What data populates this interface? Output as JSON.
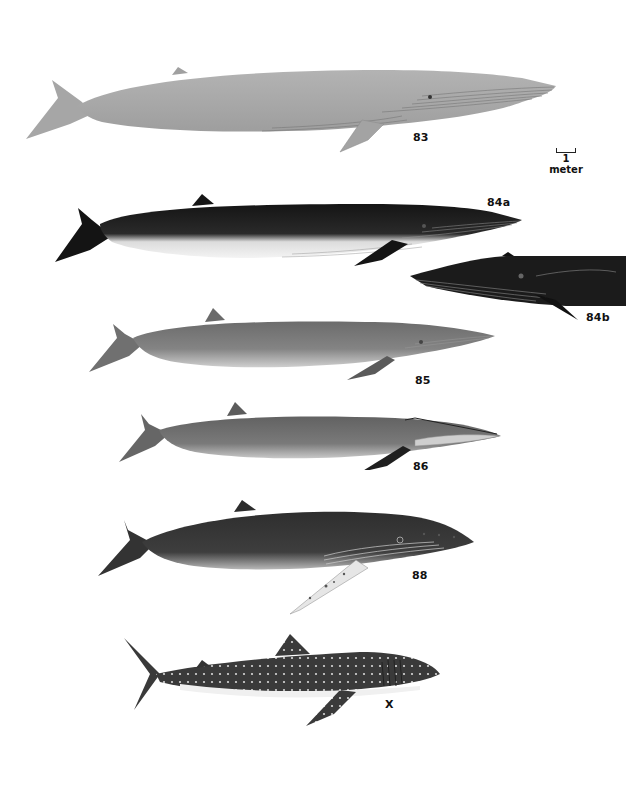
{
  "plate": {
    "background": "#ffffff",
    "scale_bar": {
      "value": "1",
      "unit": "meter"
    },
    "figures": [
      {
        "id": "83",
        "label": "83",
        "description": "Blue whale, pale gray, long slender body with throat grooves",
        "color": "#a9a9a9"
      },
      {
        "id": "84a",
        "label": "84a",
        "description": "Fin whale, dark back, white underside with throat grooves",
        "color": "#1e1e1e"
      },
      {
        "id": "84b",
        "label": "84b",
        "description": "Fin whale head detail, dark with throat grooves",
        "color": "#1a1a1a"
      },
      {
        "id": "85",
        "label": "85",
        "description": "Sei whale, medium gray, lighter belly",
        "color": "#7a7a7a"
      },
      {
        "id": "86",
        "label": "86",
        "description": "Bryde's whale, medium gray, dark flipper",
        "color": "#6e6e6e"
      },
      {
        "id": "88",
        "label": "88",
        "description": "Humpback whale, dark body, long pale mottled flipper, knobbed head",
        "color": "#3a3a3a"
      },
      {
        "id": "x",
        "label": "X",
        "description": "Whale shark, dark with white spots and stripes, white belly",
        "color": "#3c3c3c"
      }
    ]
  }
}
